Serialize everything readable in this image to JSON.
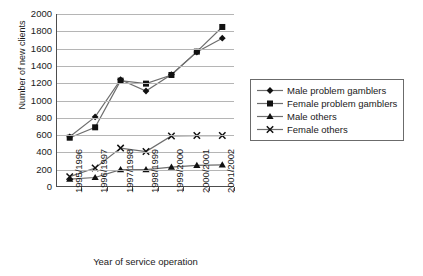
{
  "chart_data": {
    "type": "line",
    "title": "",
    "xlabel": "Year of service operation",
    "ylabel": "Number of new clients",
    "categories": [
      "1995/1996",
      "1996/1997",
      "1997/1998",
      "1998/1999",
      "1999/2000",
      "2000/2001",
      "2001/2002"
    ],
    "ylim": [
      0,
      2000
    ],
    "ytick_step": 200,
    "yticks": [
      "0",
      "200",
      "400",
      "600",
      "800",
      "1000",
      "1200",
      "1400",
      "1600",
      "1800",
      "2000"
    ],
    "grid": "horizontal",
    "legend_position": "right",
    "series": [
      {
        "name": "Male problem gamblers",
        "marker": "diamond",
        "values": [
          580,
          810,
          1240,
          1110,
          1300,
          1560,
          1720
        ]
      },
      {
        "name": "Female problem gamblers",
        "marker": "square",
        "values": [
          570,
          690,
          1230,
          1195,
          1295,
          1565,
          1850
        ]
      },
      {
        "name": "Male others",
        "marker": "triangle",
        "values": [
          90,
          110,
          200,
          200,
          230,
          250,
          255
        ]
      },
      {
        "name": "Female others",
        "marker": "cross",
        "values": [
          120,
          220,
          450,
          410,
          590,
          595,
          595
        ]
      }
    ]
  },
  "legend": {
    "items": [
      {
        "label": "Male problem gamblers"
      },
      {
        "label": "Female problem gamblers"
      },
      {
        "label": "Male others"
      },
      {
        "label": "Female others"
      }
    ]
  },
  "colors": {
    "line": "#6e6e6e",
    "marker": "#111111",
    "grid": "#b5b5b5",
    "axis": "#4d4d4d",
    "background": "#ffffff"
  }
}
